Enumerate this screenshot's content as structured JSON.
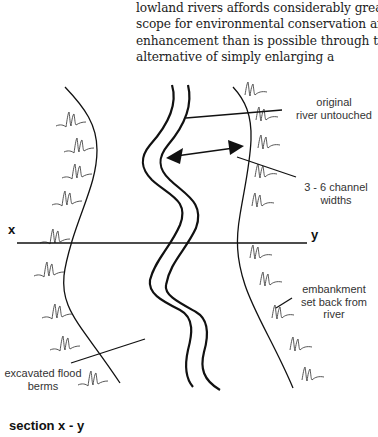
{
  "intro_text": {
    "lines": [
      "lowland rivers affords considerably greater",
      "scope for environmental conservation and",
      "enhancement than is possible through the",
      "alternative of simply enlarging a"
    ]
  },
  "diagram": {
    "labels": {
      "original_river": [
        "original",
        "river untouched"
      ],
      "channel_widths": [
        "3 - 6 channel",
        "widths"
      ],
      "embankment": [
        "embankment",
        "set back from",
        "river"
      ],
      "flood_berms": [
        "excavated flood",
        "berms"
      ]
    },
    "axis": {
      "x": "x",
      "y": "y"
    },
    "section_title": "section x - y",
    "colors": {
      "line": "#111111",
      "hatch": "#444444",
      "text": "#333333"
    }
  }
}
